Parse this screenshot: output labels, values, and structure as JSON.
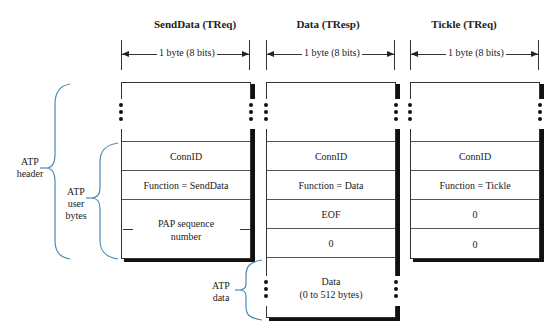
{
  "diagram": {
    "columns": [
      {
        "title": "SendData (TReq)",
        "width_label": "1 byte (8 bits)",
        "fields": [
          "ConnID",
          "Function = SendData",
          "PAP sequence number"
        ]
      },
      {
        "title": "Data (TResp)",
        "width_label": "1 byte (8 bits)",
        "fields": [
          "ConnID",
          "Function = Data",
          "EOF",
          "0",
          "Data\n(0 to 512 bytes)"
        ]
      },
      {
        "title": "Tickle (TReq)",
        "width_label": "1 byte (8 bits)",
        "fields": [
          "ConnID",
          "Function = Tickle",
          "0",
          "0"
        ]
      }
    ],
    "braces": {
      "atp_header": "ATP\nheader",
      "atp_user_bytes": "ATP\nuser\nbytes",
      "atp_data": "ATP\ndata"
    },
    "brace_color": "#4a8ab5"
  }
}
